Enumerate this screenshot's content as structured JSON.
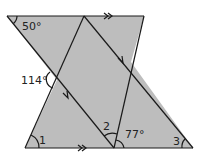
{
  "diagram": {
    "type": "geometry-parallel-lines",
    "colors": {
      "fill": "#bdbdbd",
      "stroke": "#1a1a1a",
      "background": "#ffffff"
    },
    "labels": {
      "angle_top_left": "50°",
      "angle_left": "114°",
      "angle_1": "1",
      "angle_2": "2",
      "angle_77": "77°",
      "angle_3": "3"
    },
    "markers": {
      "top_parallel": "double-arrow",
      "bottom_parallel": "double-arrow",
      "diagonal_left": "single-arrow",
      "diagonal_right": "single-arrow"
    }
  }
}
